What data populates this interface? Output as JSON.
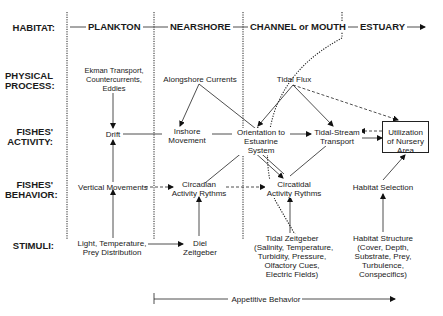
{
  "rows": {
    "habitat": "HABITAT:",
    "physical_1": "PHYSICAL",
    "physical_2": "PROCESS:",
    "activity_1": "FISHES'",
    "activity_2": "ACTIVITY:",
    "behavior_1": "FISHES'",
    "behavior_2": "BEHAVIOR:",
    "stimuli": "STIMULI:"
  },
  "habitats": [
    "PLANKTON",
    "NEARSHORE",
    "CHANNEL or MOUTH",
    "ESTUARY"
  ],
  "physical": {
    "plankton": [
      "Ekman Transport,",
      "Countercurrents,",
      "Eddies"
    ],
    "nearshore": "Alongshore Currents",
    "channel": "Tidal Flux"
  },
  "activity": {
    "drift": "Drift",
    "inshore": [
      "Inshore",
      "Movement"
    ],
    "orientation": [
      "Orientation to",
      "Estuarine",
      "System"
    ],
    "tidal_stream": [
      "Tidal-Stream",
      "Transport"
    ],
    "nursery": [
      "Utilization",
      "of Nursery",
      "Area"
    ]
  },
  "behavior": {
    "vertical": "Vertical Movements",
    "circadian": [
      "Circadian",
      "Activity Rythms"
    ],
    "circatidal": [
      "Circatidal",
      "Activity Rythms"
    ],
    "habitat_selection": "Habitat Selection"
  },
  "stimuli": {
    "light": [
      "Light, Temperature,",
      "Prey Distribution"
    ],
    "diel": [
      "Diel",
      "Zeitgeber"
    ],
    "tidal": [
      "Tidal Zeitgeber",
      "(Salinity, Temperature,",
      "Turbidity, Pressure,",
      "Olfactory Cues,",
      "Electric Fields)"
    ],
    "habitat_structure": [
      "Habitat Structure",
      "(Cover, Depth,",
      "Substrate, Prey,",
      "Turbulence,",
      "Conspecifics)"
    ]
  },
  "footer": {
    "appetitive": "Appetitive Behavior"
  }
}
